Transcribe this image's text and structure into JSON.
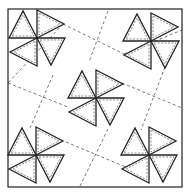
{
  "diagram": {
    "type": "quilt-block-pattern",
    "colors": {
      "background": "#ffffff",
      "stroke": "#222222",
      "dash": "#555555"
    },
    "border": {
      "x": 8,
      "y": 9,
      "width": 174,
      "height": 178
    },
    "pinwheels": [
      {
        "name": "top-left",
        "cx": 37,
        "cy": 38
      },
      {
        "name": "top-right",
        "cx": 151,
        "cy": 41
      },
      {
        "name": "center",
        "cx": 96,
        "cy": 98
      },
      {
        "name": "bottom-left",
        "cx": 36,
        "cy": 155
      },
      {
        "name": "bottom-right",
        "cx": 149,
        "cy": 155
      }
    ],
    "dashed_lines": [
      {
        "x1": 63,
        "y1": 24,
        "x2": 124,
        "y2": 54
      },
      {
        "x1": 108,
        "y1": 11,
        "x2": 89,
        "y2": 62
      },
      {
        "x1": 8,
        "y1": 83,
        "x2": 68,
        "y2": 107
      },
      {
        "x1": 53,
        "y1": 75,
        "x2": 30,
        "y2": 128
      },
      {
        "x1": 122,
        "y1": 83,
        "x2": 182,
        "y2": 108
      },
      {
        "x1": 165,
        "y1": 67,
        "x2": 141,
        "y2": 130
      },
      {
        "x1": 66,
        "y1": 142,
        "x2": 128,
        "y2": 168
      },
      {
        "x1": 108,
        "y1": 129,
        "x2": 80,
        "y2": 186
      },
      {
        "x1": 63,
        "y1": 24,
        "x2": 8,
        "y2": 83
      },
      {
        "x1": 124,
        "y1": 54,
        "x2": 182,
        "y2": 30
      }
    ]
  }
}
